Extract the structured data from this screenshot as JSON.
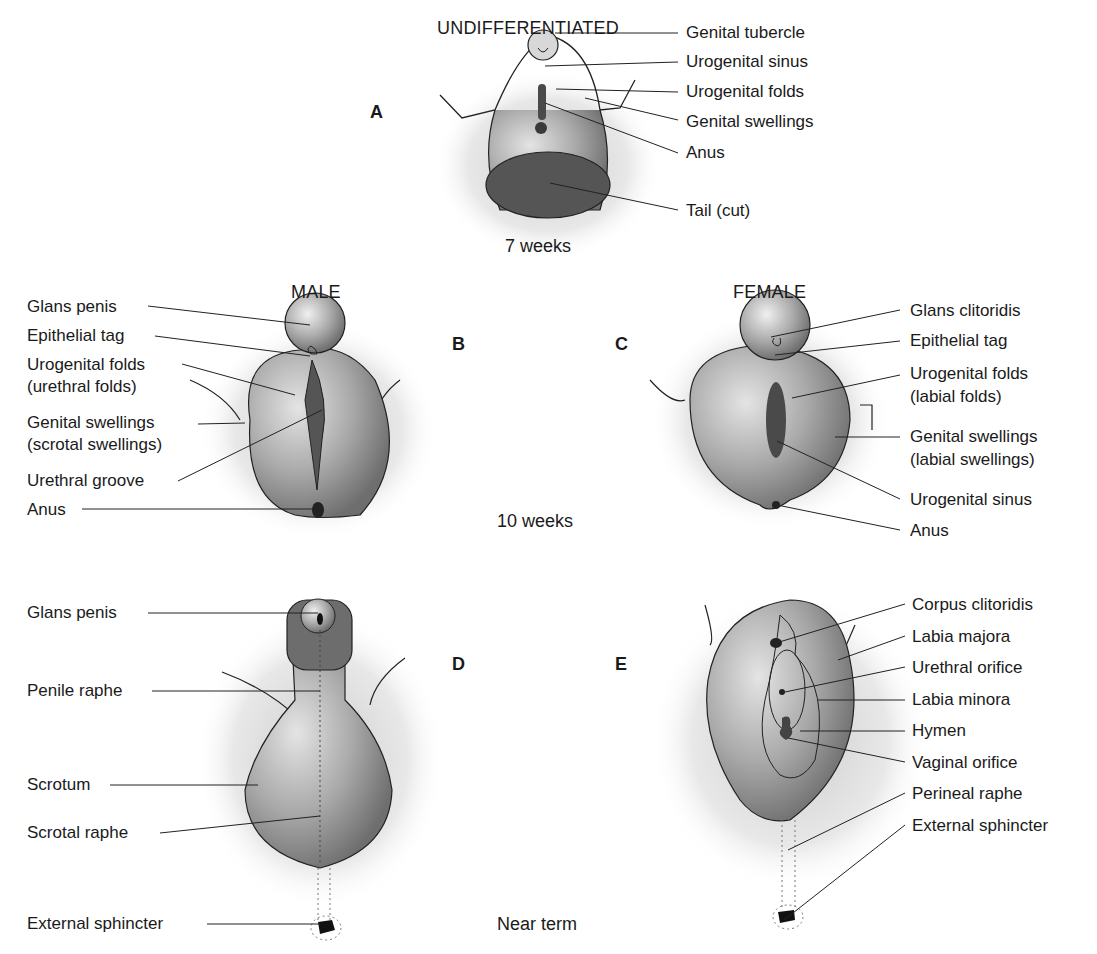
{
  "figure": {
    "headings": {
      "undifferentiated": "UNDIFFERENTIATED",
      "male": "MALE",
      "female": "FEMALE"
    },
    "stages": {
      "a": "7 weeks",
      "bc": "10 weeks",
      "de": "Near term"
    },
    "panels": {
      "a": {
        "letter": "A",
        "labels": [
          "Genital tubercle",
          "Urogenital sinus",
          "Urogenital folds",
          "Genital swellings",
          "Anus",
          "Tail (cut)"
        ]
      },
      "b": {
        "letter": "B",
        "labels": [
          "Glans penis",
          "Epithelial tag",
          "Urogenital folds",
          "(urethral folds)",
          "Genital swellings",
          "(scrotal swellings)",
          "Urethral groove",
          "Anus"
        ]
      },
      "c": {
        "letter": "C",
        "labels": [
          "Glans clitoridis",
          "Epithelial tag",
          "Urogenital folds",
          "(labial folds)",
          "Genital swellings",
          "(labial swellings)",
          "Urogenital sinus",
          "Anus"
        ]
      },
      "d": {
        "letter": "D",
        "labels": [
          "Glans penis",
          "Penile raphe",
          "Scrotum",
          "Scrotal raphe",
          "External sphincter"
        ]
      },
      "e": {
        "letter": "E",
        "labels": [
          "Corpus clitoridis",
          "Labia majora",
          "Urethral orifice",
          "Labia minora",
          "Hymen",
          "Vaginal orifice",
          "Perineal raphe",
          "External sphincter"
        ]
      }
    }
  }
}
